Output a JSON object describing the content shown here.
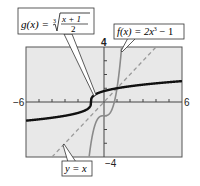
{
  "chart_data": {
    "type": "line",
    "title": "",
    "xlabel": "",
    "ylabel": "",
    "xlim": [
      -6,
      6
    ],
    "ylim": [
      -4,
      4
    ],
    "grid": false,
    "tick_labels": {
      "x_min": "−6",
      "x_max": "6",
      "y_min": "−4",
      "y_max": "4"
    },
    "series": [
      {
        "name": "g(x) = ∛((x + 1)/2)",
        "style": "solid-thick-black",
        "function": "cbrt((x+1)/2)"
      },
      {
        "name": "f(x) = 2x³ − 1",
        "style": "solid-gray",
        "function": "2*x^3 - 1"
      },
      {
        "name": "y = x",
        "style": "dashed-gray",
        "function": "x"
      }
    ],
    "annotations": [
      {
        "text": "g(x) = ∛((x+1)/2)",
        "points_to": [
          -0.8,
          0.3
        ]
      },
      {
        "text": "f(x) = 2x³ − 1",
        "points_to": [
          1.3,
          3.4
        ]
      },
      {
        "text": "y = x",
        "points_to": [
          -3.2,
          -3.1
        ]
      }
    ]
  },
  "labels": {
    "g_prefix": "g(x) = ",
    "g_index": "3",
    "g_num": "x + 1",
    "g_den": "2",
    "f_label": "f(x) = 2x",
    "f_exp": "3",
    "f_tail": " − 1",
    "y_label": "y = x",
    "tick_x_min": "−6",
    "tick_x_max": "6",
    "tick_y_max": "4",
    "tick_y_min": "−4"
  },
  "colors": {
    "plot_bg": "#e8e8e8",
    "frame": "#555555",
    "g_curve": "#111111",
    "f_curve": "#8a8a8a",
    "identity_line": "#9a9a9a"
  }
}
